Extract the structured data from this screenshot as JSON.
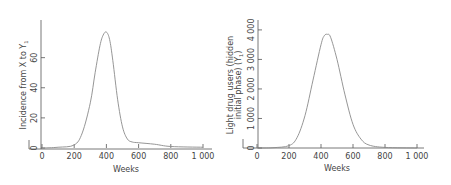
{
  "chart_data": [
    {
      "type": "line",
      "title": "",
      "xlabel": "Weeks",
      "ylabel": "Incidence from X to Y",
      "ylabel_subscript": "1",
      "xlim": [
        0,
        1000
      ],
      "ylim": [
        0,
        85
      ],
      "x_ticks": [
        "0",
        "200",
        "400",
        "600",
        "800",
        "1 000"
      ],
      "y_ticks": [
        "0",
        "20",
        "40",
        "60"
      ],
      "grid": false,
      "legend": null,
      "series": [
        {
          "name": "Incidence from X to Y1",
          "x": [
            0,
            100,
            200,
            250,
            300,
            330,
            360,
            380,
            400,
            420,
            440,
            470,
            500,
            530,
            560,
            600,
            700,
            800,
            1000
          ],
          "y": [
            0,
            0.5,
            2,
            10,
            30,
            50,
            68,
            75,
            77,
            72,
            58,
            32,
            14,
            6,
            4,
            3.5,
            2.5,
            1,
            0.5
          ]
        }
      ]
    },
    {
      "type": "line",
      "title": "",
      "xlabel": "Weeks",
      "ylabel": "Light drug users (hidden initial phase) (Y)",
      "ylabel_line1": "Light drug users (hidden",
      "ylabel_line2": "initial phase) (Y",
      "ylabel_subscript": "1",
      "xlim": [
        0,
        1000
      ],
      "ylim": [
        0,
        4200
      ],
      "x_ticks": [
        "0",
        "200",
        "400",
        "600",
        "800",
        "1 000"
      ],
      "y_ticks": [
        "0",
        "1 000",
        "2 000",
        "3 000",
        "4 000"
      ],
      "grid": false,
      "legend": null,
      "series": [
        {
          "name": "Light drug users Y1",
          "x": [
            0,
            100,
            200,
            250,
            300,
            350,
            400,
            420,
            440,
            460,
            500,
            550,
            600,
            650,
            700,
            800,
            1000
          ],
          "y": [
            0,
            10,
            80,
            350,
            1100,
            2300,
            3500,
            3800,
            3850,
            3750,
            3000,
            1800,
            800,
            300,
            100,
            20,
            0
          ]
        }
      ]
    }
  ]
}
